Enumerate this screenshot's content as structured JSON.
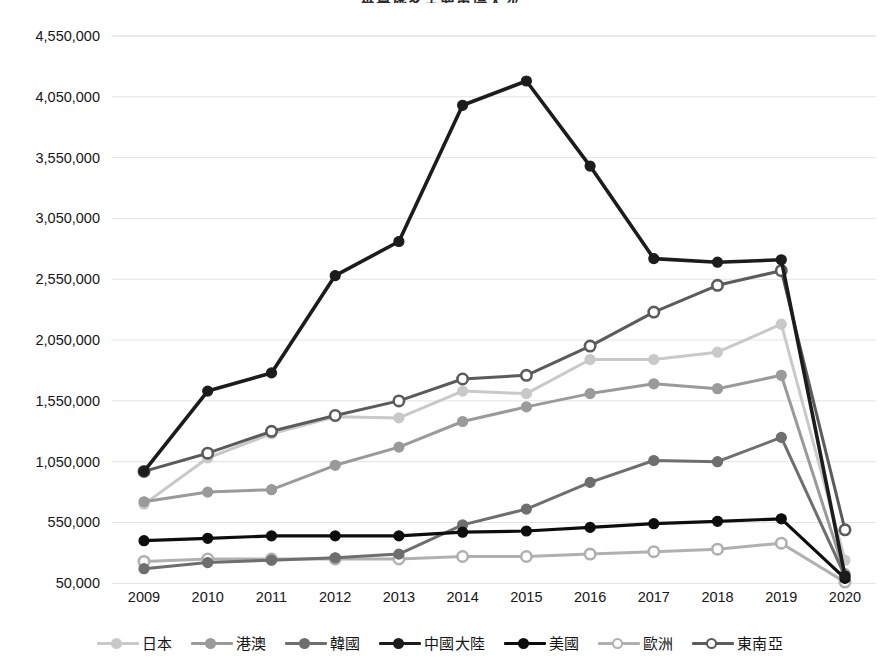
{
  "chart_data": {
    "type": "line",
    "title": "來臺旅客主要市場人次",
    "xlabel": "",
    "ylabel": "",
    "x": [
      2009,
      2010,
      2011,
      2012,
      2013,
      2014,
      2015,
      2016,
      2017,
      2018,
      2019,
      2020
    ],
    "categories": [
      "2009",
      "2010",
      "2011",
      "2012",
      "2013",
      "2014",
      "2015",
      "2016",
      "2017",
      "2018",
      "2019",
      "2020"
    ],
    "ylim": [
      50000,
      4550000
    ],
    "ytick_values": [
      50000,
      550000,
      1050000,
      1550000,
      2050000,
      2550000,
      3050000,
      3550000,
      4050000,
      4550000
    ],
    "ytick_labels": [
      "50,000",
      "550,000",
      "1,050,000",
      "1,550,000",
      "2,050,000",
      "2,550,000",
      "3,050,000",
      "3,550,000",
      "4,050,000",
      "4,550,000"
    ],
    "grid": true,
    "legend_position": "bottom",
    "series": [
      {
        "name": "日本",
        "color": "#c9c9c9",
        "marker": "filled",
        "marker_fill": "#c9c9c9",
        "values": [
          700000,
          1080000,
          1280000,
          1420000,
          1410000,
          1630000,
          1610000,
          1890000,
          1890000,
          1950000,
          2180000,
          240000
        ]
      },
      {
        "name": "港澳",
        "color": "#9a9a9a",
        "marker": "filled",
        "marker_fill": "#9a9a9a",
        "values": [
          720000,
          800000,
          820000,
          1020000,
          1170000,
          1380000,
          1500000,
          1610000,
          1690000,
          1650000,
          1760000,
          130000
        ]
      },
      {
        "name": "韓國",
        "color": "#6e6e6e",
        "marker": "filled",
        "marker_fill": "#6e6e6e",
        "values": [
          170000,
          220000,
          240000,
          260000,
          290000,
          530000,
          660000,
          880000,
          1060000,
          1050000,
          1250000,
          110000
        ]
      },
      {
        "name": "中國大陸",
        "color": "#1c1c1c",
        "marker": "filled",
        "marker_fill": "#1c1c1c",
        "values": [
          970000,
          1630000,
          1780000,
          2580000,
          2860000,
          3980000,
          4180000,
          3480000,
          2720000,
          2690000,
          2710000,
          110000
        ]
      },
      {
        "name": "美國",
        "color": "#0d0d0d",
        "marker": "filled",
        "marker_fill": "#0d0d0d",
        "values": [
          400000,
          420000,
          440000,
          440000,
          440000,
          470000,
          480000,
          510000,
          540000,
          560000,
          580000,
          90000
        ]
      },
      {
        "name": "歐洲",
        "color": "#b0b0b0",
        "marker": "hollow",
        "marker_fill": "#ffffff",
        "values": [
          230000,
          250000,
          250000,
          250000,
          250000,
          270000,
          270000,
          290000,
          310000,
          330000,
          380000,
          60000
        ]
      },
      {
        "name": "東南亞",
        "color": "#5b5b5b",
        "marker": "hollow",
        "marker_fill": "#ffffff",
        "values": [
          970000,
          1120000,
          1300000,
          1430000,
          1550000,
          1730000,
          1760000,
          2000000,
          2280000,
          2500000,
          2620000,
          490000
        ]
      }
    ]
  },
  "axis": {
    "gridline_color": "#e3e3e3",
    "tick_text_color": "#161616"
  }
}
